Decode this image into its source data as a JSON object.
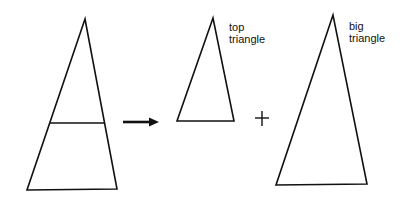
{
  "diagram": {
    "labels": {
      "top_triangle": [
        "top",
        "triangle"
      ],
      "big_triangle": [
        "big",
        "triangle"
      ]
    },
    "operators": {
      "arrow": "→",
      "plus": "+"
    },
    "colors": {
      "stroke": "#111111",
      "background": "#ffffff"
    }
  }
}
